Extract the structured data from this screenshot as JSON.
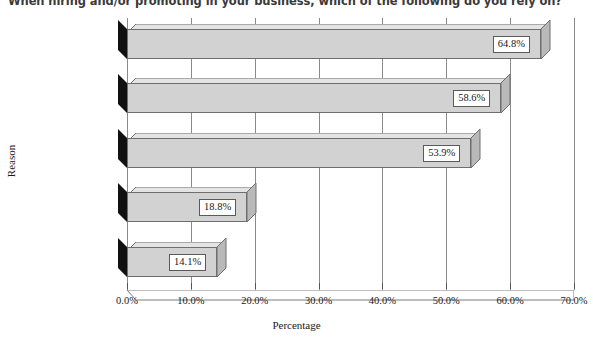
{
  "chart_data": {
    "type": "bar",
    "orientation": "horizontal",
    "title": "When hiring and/or promoting in your business, which of the following do you rely on?",
    "xlabel": "Percentage",
    "ylabel": "Reason",
    "categories": [
      "Personality/likeability",
      "Skills",
      "Track record",
      "Knowledge of\nthe organization",
      "Diversity"
    ],
    "values": [
      64.8,
      58.6,
      53.9,
      18.8,
      14.1
    ],
    "value_labels": [
      "64.8%",
      "58.6%",
      "53.9%",
      "18.8%",
      "14.1%"
    ],
    "xlim": [
      0,
      70
    ],
    "xticks": [
      0,
      10,
      20,
      30,
      40,
      50,
      60,
      70
    ],
    "xtick_labels": [
      "0.0%",
      "10.0%",
      "20.0%",
      "30.0%",
      "40.0%",
      "50.0%",
      "60.0%",
      "70.0%"
    ],
    "grid": "vertical",
    "legend": "none",
    "style": "3d-bars-grayscale",
    "colors": {
      "bar_front": "#d2d2d2",
      "bar_top": "#e4e4e4",
      "bar_side": "#b9b9b9",
      "bar_outline": "#6e6e6e",
      "origin_wedge": "#111111",
      "gridline": "#8a8a8a",
      "axis": "#6a6a6a",
      "text": "#1a1a1a",
      "background": "#ffffff"
    }
  }
}
